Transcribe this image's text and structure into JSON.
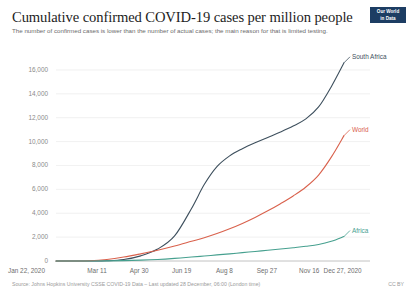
{
  "header": {
    "title": "Cumulative confirmed COVID-19 cases per million people",
    "subtitle": "The number of confirmed cases is lower than the number of actual cases; the main reason for that is limited testing.",
    "logo_line1": "Our World",
    "logo_line2": "in Data"
  },
  "footer": {
    "source": "Source: Johns Hopkins University CSSE COVID-19 Data – Last updated 28 December, 06:00 (London time)",
    "license": "CC BY"
  },
  "colors": {
    "south_africa": "#3d4f5d",
    "world": "#d9614c",
    "africa": "#46a08f",
    "axis": "#8a8a8a",
    "grid": "#e8e8e8",
    "logo_bg": "#1d3d63"
  },
  "chart_data": {
    "type": "line",
    "title": "Cumulative confirmed COVID-19 cases per million people",
    "subtitle": "The number of confirmed cases is lower than the number of actual cases; the main reason for that is limited testing.",
    "xlabel": "",
    "ylabel": "",
    "grid": false,
    "legend": "inline-right-end-labels",
    "ylim": [
      0,
      17000
    ],
    "yticks": [
      0,
      2000,
      4000,
      6000,
      8000,
      10000,
      12000,
      14000,
      16000
    ],
    "ytick_labels": [
      "0",
      "2,000",
      "4,000",
      "6,000",
      "8,000",
      "10,000",
      "12,000",
      "14,000",
      "16,000"
    ],
    "xlim": [
      "Jan 22, 2020",
      "Dec 27, 2020"
    ],
    "xticks": [
      0,
      49,
      99,
      149,
      199,
      249,
      299,
      340
    ],
    "xtick_labels": [
      "Jan 22, 2020",
      "Mar 11",
      "Apr 30",
      "Jun 19",
      "Aug 8",
      "Sep 27",
      "Nov 16",
      "Dec 27, 2020"
    ],
    "x_days": [
      0,
      20,
      40,
      60,
      80,
      100,
      120,
      140,
      160,
      175,
      190,
      205,
      220,
      235,
      250,
      265,
      280,
      295,
      310,
      325,
      340
    ],
    "series": [
      {
        "name": "South Africa",
        "color": "#3d4f5d",
        "end_label": "South Africa",
        "end_value": 16600,
        "values": [
          0,
          0,
          2,
          20,
          120,
          430,
          1000,
          2100,
          4400,
          6400,
          7900,
          8800,
          9400,
          9900,
          10350,
          10800,
          11300,
          11900,
          12900,
          14600,
          16600
        ]
      },
      {
        "name": "World",
        "color": "#d9614c",
        "end_label": "World",
        "end_value": 10500,
        "values": [
          0,
          1,
          25,
          130,
          330,
          600,
          900,
          1250,
          1650,
          1950,
          2300,
          2700,
          3150,
          3650,
          4200,
          4800,
          5450,
          6200,
          7200,
          8700,
          10500
        ]
      },
      {
        "name": "Africa",
        "color": "#46a08f",
        "end_label": "Africa",
        "end_value": 2050,
        "values": [
          0,
          0,
          1,
          8,
          30,
          70,
          130,
          220,
          330,
          420,
          510,
          600,
          700,
          800,
          900,
          1000,
          1110,
          1230,
          1380,
          1650,
          2050
        ]
      }
    ]
  }
}
